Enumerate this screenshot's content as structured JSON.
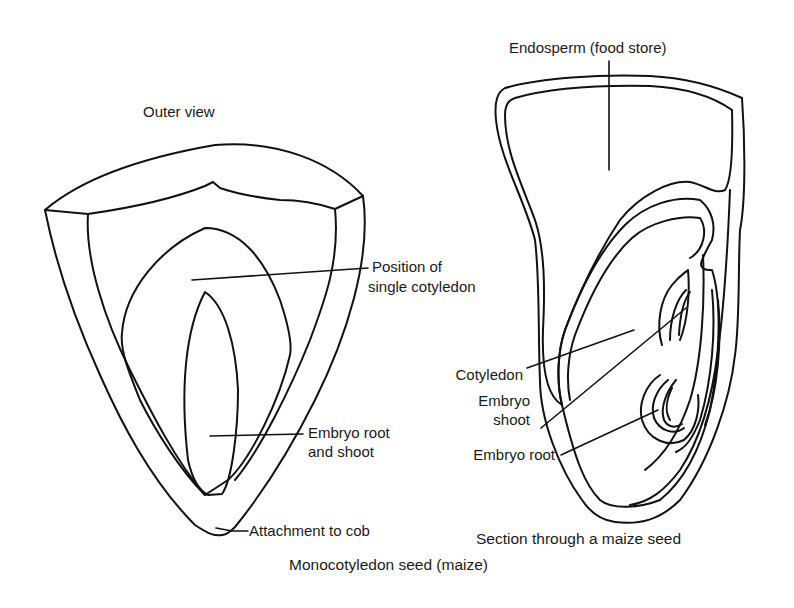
{
  "figure": {
    "caption": "Monocotyledon seed (maize)"
  },
  "outer_view": {
    "title": "Outer view",
    "labels": {
      "cotyledon_line1": "Position of",
      "cotyledon_line2": "single cotyledon",
      "embryo_line1": "Embryo root",
      "embryo_line2": "and shoot",
      "attachment": "Attachment to cob"
    }
  },
  "section_view": {
    "title": "Section through a maize seed",
    "labels": {
      "endosperm": "Endosperm (food store)",
      "cotyledon": "Cotyledon",
      "embryo_shoot_line1": "Embryo",
      "embryo_shoot_line2": "shoot",
      "embryo_root": "Embryo root"
    }
  },
  "colors": {
    "line": "#111111",
    "background": "#ffffff"
  }
}
